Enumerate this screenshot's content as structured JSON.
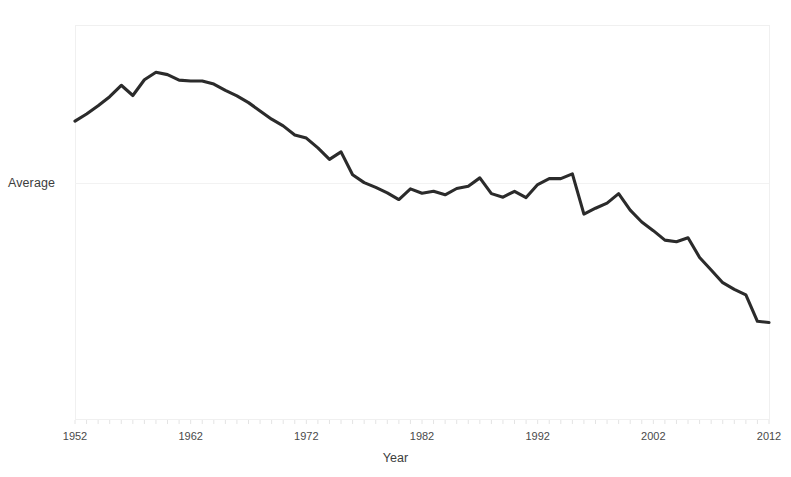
{
  "chart_data": {
    "type": "line",
    "title": "",
    "xlabel": "Year",
    "ylabel": "Average",
    "grid": true,
    "legend": false,
    "xlim": [
      1952,
      2012
    ],
    "ylim": [
      0,
      100
    ],
    "xticks": [
      "1952",
      "1962",
      "1972",
      "1982",
      "1992",
      "2002",
      "2012"
    ],
    "yticks": [
      ""
    ],
    "series": [
      {
        "name": "Average",
        "color": "#2b2b2b",
        "x": [
          1952,
          1953,
          1954,
          1955,
          1956,
          1957,
          1958,
          1959,
          1960,
          1961,
          1962,
          1963,
          1964,
          1965,
          1966,
          1967,
          1968,
          1969,
          1970,
          1971,
          1972,
          1973,
          1974,
          1975,
          1976,
          1977,
          1978,
          1979,
          1980,
          1981,
          1982,
          1983,
          1984,
          1985,
          1986,
          1987,
          1988,
          1989,
          1990,
          1991,
          1992,
          1993,
          1994,
          1995,
          1996,
          1997,
          1998,
          1999,
          2000,
          2001,
          2002,
          2003,
          2004,
          2005,
          2006,
          2007,
          2008,
          2009,
          2010,
          2011,
          2012
        ],
        "values": [
          75.6,
          77.4,
          79.5,
          81.8,
          84.7,
          82.1,
          86.1,
          88.0,
          87.4,
          86.0,
          85.8,
          85.8,
          85.0,
          83.4,
          82.0,
          80.3,
          78.2,
          76.1,
          74.4,
          72.1,
          71.3,
          68.8,
          65.9,
          67.8,
          62.0,
          60.0,
          58.8,
          57.4,
          55.7,
          58.4,
          57.3,
          57.8,
          56.9,
          58.5,
          59.1,
          61.2,
          57.2,
          56.3,
          57.8,
          56.2,
          59.5,
          61.0,
          61.0,
          62.2,
          52.0,
          53.5,
          54.8,
          57.2,
          53.0,
          50.0,
          47.8,
          45.4,
          45.0,
          46.0,
          41.0,
          37.8,
          34.6,
          32.9,
          31.5,
          24.8,
          24.5
        ]
      }
    ]
  },
  "axes": {
    "x_title": "Year",
    "y_title": "Average",
    "x_tick_labels": [
      "1952",
      "1962",
      "1972",
      "1982",
      "1992",
      "2002",
      "2012"
    ]
  }
}
